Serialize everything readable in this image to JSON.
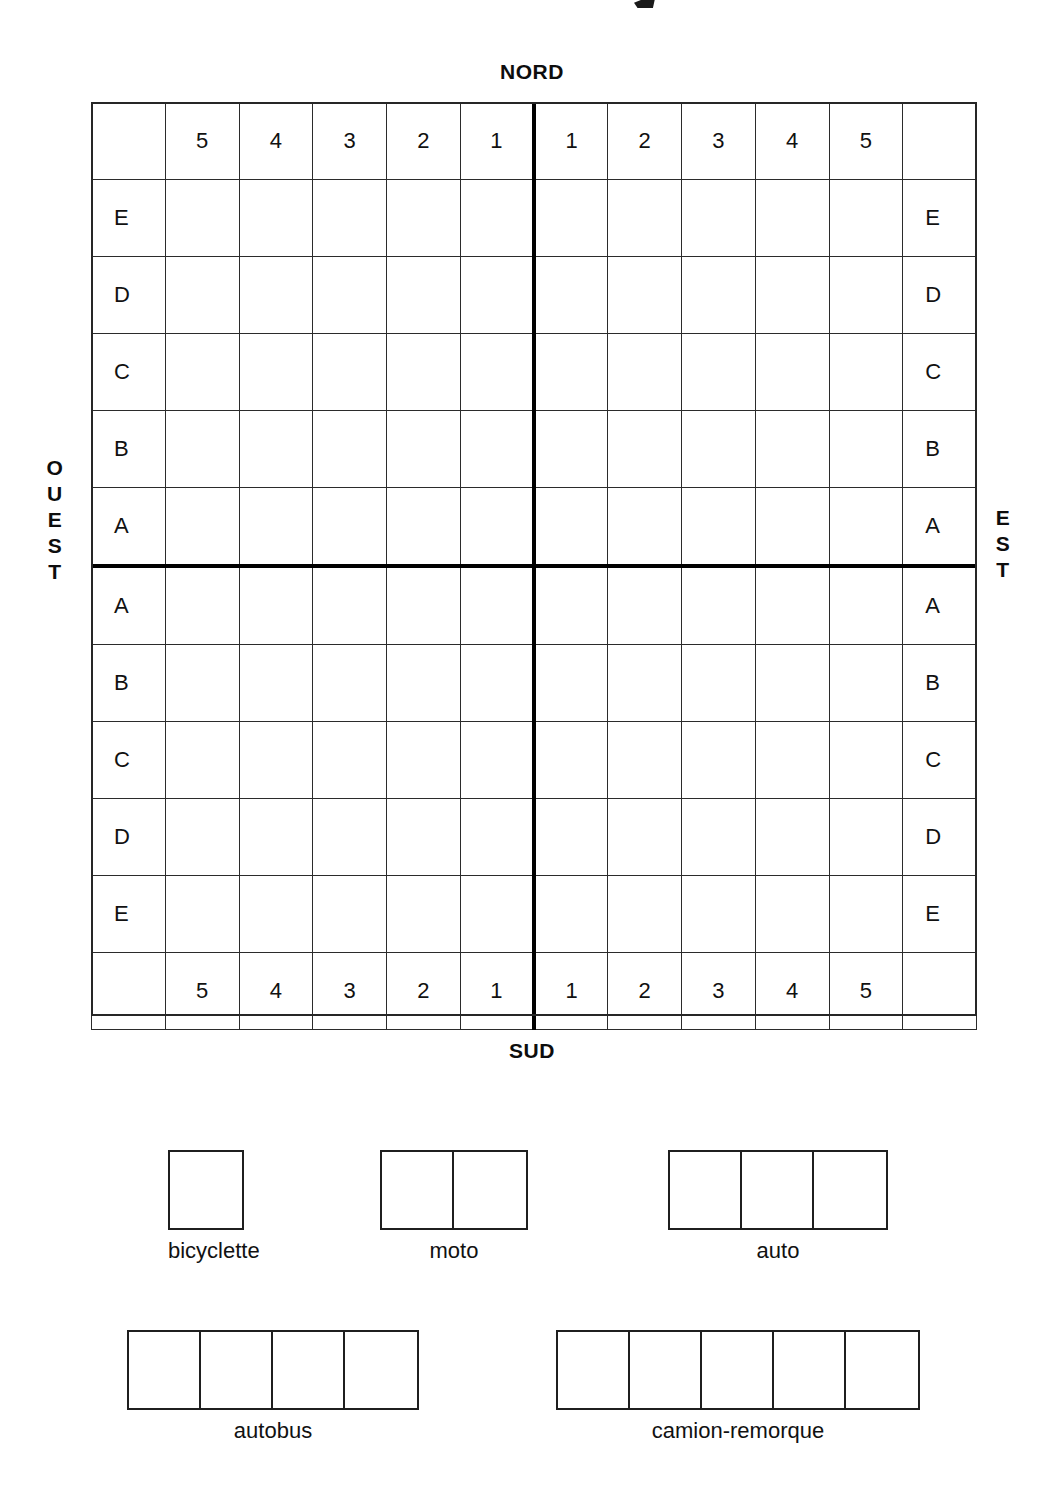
{
  "page": {
    "background_color": "#ffffff",
    "ink_color": "#111111",
    "accent_color": "#000000"
  },
  "compass": {
    "north": "NORD",
    "south": "SUD",
    "west": "OUEST",
    "east": "EST",
    "west_letters": [
      "O",
      "U",
      "E",
      "S",
      "T"
    ],
    "east_letters": [
      "E",
      "S",
      "T"
    ]
  },
  "grid": {
    "columns": 12,
    "rows": 12,
    "column_headers": [
      "",
      "5",
      "4",
      "3",
      "2",
      "1",
      "1",
      "2",
      "3",
      "4",
      "5",
      ""
    ],
    "column_footers": [
      "",
      "5",
      "4",
      "3",
      "2",
      "1",
      "1",
      "2",
      "3",
      "4",
      "5",
      ""
    ],
    "row_labels_left": [
      "E",
      "D",
      "C",
      "B",
      "A",
      "A",
      "B",
      "C",
      "D",
      "E"
    ],
    "row_labels_right": [
      "E",
      "D",
      "C",
      "B",
      "A",
      "A",
      "B",
      "C",
      "D",
      "E"
    ],
    "axis_line_column_index": 6,
    "axis_line_row_index": 6,
    "cells_empty": true
  },
  "legend": {
    "rows": [
      [
        {
          "label": "bicyclette",
          "cells": 1,
          "left": 168
        },
        {
          "label": "moto",
          "cells": 2,
          "left": 380
        },
        {
          "label": "auto",
          "cells": 3,
          "left": 668
        }
      ],
      [
        {
          "label": "autobus",
          "cells": 4,
          "left": 127
        },
        {
          "label": "camion-remorque",
          "cells": 5,
          "left": 556
        }
      ]
    ]
  }
}
